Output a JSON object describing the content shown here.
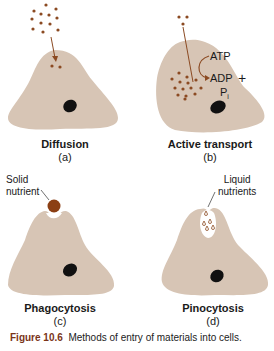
{
  "figure": {
    "number": "Figure 10.6",
    "caption": "Methods of entry of materials into cells.",
    "colors": {
      "cell": "#d7c5b5",
      "particle": "#8b4a22",
      "arrow": "#8b4a22",
      "nucleus": "#111111",
      "solid_nutrient": "#8b3f14",
      "caption_label": "#7a3418"
    }
  },
  "panels": [
    {
      "id": "a",
      "title": "Diffusion",
      "letter": "(a)"
    },
    {
      "id": "b",
      "title": "Active transport",
      "letter": "(b)",
      "labels": {
        "atp": "ATP",
        "adp": "ADP",
        "plus": "+",
        "pi": "P",
        "pi_sub": "i"
      }
    },
    {
      "id": "c",
      "title": "Phagocytosis",
      "letter": "(c)",
      "annotation": [
        "Solid",
        "nutrient"
      ]
    },
    {
      "id": "d",
      "title": "Pinocytosis",
      "letter": "(d)",
      "annotation": [
        "Liquid",
        "nutrients"
      ]
    }
  ]
}
